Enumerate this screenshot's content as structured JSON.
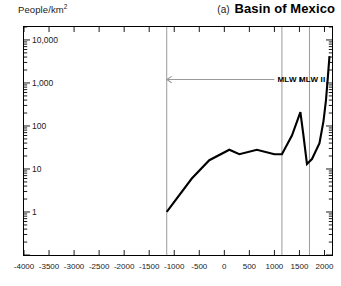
{
  "header": {
    "y_axis_label": "People/km",
    "y_axis_label_sup": "2",
    "panel_letter": "(a)",
    "panel_title": "Basin of Mexico"
  },
  "chart_data": {
    "type": "line",
    "title": "(a) Basin of Mexico",
    "xlabel": "",
    "ylabel": "People/km2",
    "yscale": "log",
    "ylim": [
      0.1,
      20000
    ],
    "xlim": [
      -4000,
      2150
    ],
    "grid": false,
    "legend": null,
    "ytick_values": [
      10000,
      1000,
      100,
      10,
      1
    ],
    "ytick_labels": [
      "10,000",
      "1,000",
      "100",
      "10",
      "1"
    ],
    "xtick_values": [
      -4000,
      -3500,
      -3000,
      -2500,
      -2000,
      -1500,
      -1000,
      -500,
      0,
      500,
      1000,
      1500,
      2000
    ],
    "xtick_labels": [
      "-4000",
      "-3500",
      "-3000",
      "-2500",
      "-2000",
      "-1500",
      "-1000",
      "-500",
      "0",
      "500",
      "1000",
      "1500",
      "2000"
    ],
    "series": [
      {
        "name": "Basin of Mexico population density",
        "x": [
          -1150,
          -650,
          -300,
          100,
          300,
          650,
          1000,
          1150,
          1350,
          1519,
          1580,
          1650,
          1750,
          1900,
          1980,
          2030,
          2070,
          2100
        ],
        "y": [
          1.0,
          6.0,
          16.0,
          28.0,
          22.0,
          28.0,
          22.0,
          22.0,
          60.0,
          210.0,
          60.0,
          13.0,
          17.0,
          40.0,
          130.0,
          400.0,
          1500.0,
          4200.0
        ]
      }
    ],
    "vertical_lines": [
      -1150,
      1150,
      1700
    ],
    "annotations": [
      {
        "text": "MLW I",
        "x_label": 1000,
        "y_label": 1200,
        "arrow_from_x": 1000,
        "arrow_to_x": -1150,
        "arrow_direction": "left"
      },
      {
        "text": "MLW II",
        "x_label": 1430,
        "y_label": 1200
      }
    ]
  },
  "annotations": {
    "mlw_1": "MLW I",
    "mlw_2": "MLW II"
  },
  "colors": {
    "line": "#000000",
    "axis": "#000000",
    "vertical_line": "#9a9a9a",
    "arrow": "#9a9a9a",
    "background": "#ffffff"
  }
}
